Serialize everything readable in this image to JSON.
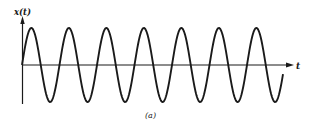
{
  "figure": {
    "y_axis_label": "x(t)",
    "x_axis_label": "t",
    "caption": "(a)",
    "colors": {
      "line": "#1a1a1a",
      "background": "#ffffff"
    }
  },
  "chart_data": {
    "type": "line",
    "title": "",
    "xlabel": "t",
    "ylabel": "x(t)",
    "caption": "(a)",
    "function": "sinusoid",
    "cycles": 7,
    "starts_at": "zero, rising",
    "grid": false,
    "legend": null,
    "geometry_px": {
      "origin": [
        22,
        65
      ],
      "amplitude": 37,
      "period": 37.5,
      "x_end": 283,
      "axis_x_end": 293,
      "axis_y_top": 18,
      "axis_y_bottom": 104
    }
  }
}
